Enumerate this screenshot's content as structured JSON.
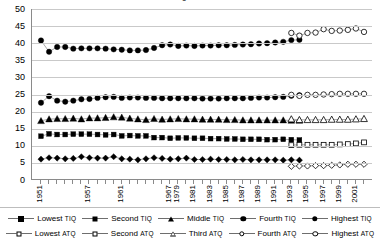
{
  "chart_data": {
    "type": "line",
    "title": "Figure 2",
    "xlabel": "",
    "ylabel": "",
    "ylim": [
      0,
      50
    ],
    "yticks": [
      0,
      5,
      10,
      15,
      20,
      25,
      30,
      35,
      40,
      45,
      50
    ],
    "grid": true,
    "legend_position": "bottom",
    "x": [
      1951,
      1952,
      1953,
      1954,
      1955,
      1956,
      1957,
      1958,
      1959,
      1960,
      1961,
      1962,
      1963,
      1964,
      1965,
      1966,
      1967,
      1979,
      1980,
      1981,
      1982,
      1983,
      1984,
      1985,
      1986,
      1987,
      1988,
      1989,
      1990,
      1991,
      1992,
      1993,
      1994,
      1995,
      1996,
      1997,
      1998,
      1999,
      2000,
      2001,
      2002
    ],
    "xtick_labels": [
      "1951",
      "1957",
      "1961",
      "1967",
      "1979",
      "1981",
      "1983",
      "1985",
      "1987",
      "1989",
      "1991",
      "1993",
      "1995",
      "1997",
      "1999",
      "2001"
    ],
    "xtick_positions": [
      1951,
      1957,
      1961,
      1967,
      1979,
      1981,
      1983,
      1985,
      1987,
      1989,
      1991,
      1993,
      1995,
      1997,
      1999,
      2001
    ],
    "series": [
      {
        "name": "Lowest TIQ",
        "marker": "diamond-filled",
        "group": "TIQ",
        "values": [
          6.1,
          6.5,
          6.4,
          6.2,
          6.3,
          6.8,
          6.5,
          6.4,
          6.4,
          6.8,
          6.2,
          6.1,
          5.9,
          6.2,
          6.5,
          6.3,
          6.1,
          6.2,
          6.4,
          6.0,
          6.0,
          6.1,
          6.0,
          6.0,
          5.9,
          6.0,
          5.9,
          5.9,
          5.9,
          5.9,
          5.8,
          5.9,
          5.8,
          null,
          null,
          null,
          null,
          null,
          null,
          null,
          null
        ]
      },
      {
        "name": "Second TIQ",
        "marker": "square-filled",
        "group": "TIQ",
        "values": [
          12.8,
          13.5,
          13.3,
          13.3,
          13.4,
          13.4,
          13.4,
          13.3,
          13.2,
          13.3,
          12.9,
          13.0,
          12.9,
          12.9,
          12.4,
          12.4,
          12.2,
          12.3,
          12.3,
          12.2,
          12.2,
          12.1,
          12.1,
          12.0,
          12.0,
          11.9,
          11.9,
          11.9,
          11.8,
          11.8,
          11.9,
          11.8,
          11.7,
          null,
          null,
          null,
          null,
          null,
          null,
          null,
          null
        ]
      },
      {
        "name": "Middle TIQ",
        "marker": "triangle-filled",
        "group": "TIQ",
        "values": [
          17.3,
          17.8,
          17.9,
          17.9,
          18.0,
          17.8,
          18.1,
          18.1,
          18.2,
          18.4,
          18.3,
          18.0,
          17.8,
          17.6,
          17.9,
          17.7,
          17.8,
          17.9,
          17.8,
          17.8,
          17.7,
          17.7,
          17.7,
          17.6,
          17.6,
          17.5,
          17.5,
          17.5,
          17.5,
          17.5,
          17.5,
          17.4,
          17.4,
          null,
          null,
          null,
          null,
          null,
          null,
          null,
          null
        ]
      },
      {
        "name": "Fourth TIQ",
        "marker": "circle-filled",
        "group": "TIQ",
        "values": [
          22.6,
          24.5,
          23.2,
          22.9,
          23.2,
          23.6,
          23.7,
          24.0,
          24.2,
          24.3,
          24.0,
          24.1,
          24.1,
          24.0,
          24.0,
          23.9,
          23.9,
          23.9,
          23.9,
          23.9,
          23.8,
          23.8,
          23.8,
          23.9,
          23.9,
          23.9,
          24.0,
          24.1,
          24.1,
          24.2,
          24.3,
          24.6,
          24.8,
          null,
          null,
          null,
          null,
          null,
          null,
          null,
          null
        ]
      },
      {
        "name": "Highest TIQ",
        "marker": "circle-filled",
        "group": "TIQ",
        "values": [
          40.8,
          37.5,
          38.9,
          38.9,
          38.4,
          38.5,
          38.5,
          38.5,
          38.4,
          38.2,
          38.1,
          37.9,
          37.9,
          38.0,
          38.6,
          39.4,
          39.6,
          39.2,
          39.3,
          39.2,
          39.3,
          39.3,
          39.4,
          39.4,
          39.5,
          39.6,
          39.7,
          39.9,
          40.0,
          40.2,
          40.4,
          40.9,
          41.0,
          null,
          null,
          null,
          null,
          null,
          null,
          null,
          null
        ]
      },
      {
        "name": "Lowest ATQ",
        "marker": "diamond-open",
        "group": "ATQ",
        "values": [
          null,
          null,
          null,
          null,
          null,
          null,
          null,
          null,
          null,
          null,
          null,
          null,
          null,
          null,
          null,
          null,
          null,
          null,
          null,
          null,
          null,
          null,
          null,
          null,
          null,
          null,
          null,
          null,
          null,
          null,
          null,
          4.0,
          4.1,
          4.1,
          4.2,
          4.2,
          4.3,
          4.4,
          4.6,
          4.6,
          4.6
        ]
      },
      {
        "name": "Second ATQ",
        "marker": "square-open",
        "group": "ATQ",
        "values": [
          null,
          null,
          null,
          null,
          null,
          null,
          null,
          null,
          null,
          null,
          null,
          null,
          null,
          null,
          null,
          null,
          null,
          null,
          null,
          null,
          null,
          null,
          null,
          null,
          null,
          null,
          null,
          null,
          null,
          null,
          null,
          10.2,
          10.3,
          10.3,
          10.3,
          10.3,
          10.3,
          10.4,
          10.5,
          10.7,
          11.0
        ]
      },
      {
        "name": "Third ATQ",
        "marker": "triangle-open",
        "group": "ATQ",
        "values": [
          null,
          null,
          null,
          null,
          null,
          null,
          null,
          null,
          null,
          null,
          null,
          null,
          null,
          null,
          null,
          null,
          null,
          null,
          null,
          null,
          null,
          null,
          null,
          null,
          null,
          null,
          null,
          null,
          null,
          null,
          null,
          17.8,
          17.6,
          17.6,
          17.6,
          17.6,
          17.7,
          17.7,
          17.7,
          17.8,
          17.9
        ]
      },
      {
        "name": "Fourth ATQ",
        "marker": "circle-open",
        "group": "ATQ",
        "values": [
          null,
          null,
          null,
          null,
          null,
          null,
          null,
          null,
          null,
          null,
          null,
          null,
          null,
          null,
          null,
          null,
          null,
          null,
          null,
          null,
          null,
          null,
          null,
          null,
          null,
          null,
          null,
          null,
          null,
          null,
          null,
          24.9,
          24.6,
          24.9,
          24.9,
          25.0,
          25.1,
          25.2,
          25.2,
          25.2,
          25.2
        ]
      },
      {
        "name": "Highest ATQ",
        "marker": "circle-open",
        "group": "ATQ",
        "values": [
          null,
          null,
          null,
          null,
          null,
          null,
          null,
          null,
          null,
          null,
          null,
          null,
          null,
          null,
          null,
          null,
          null,
          null,
          null,
          null,
          null,
          null,
          null,
          null,
          null,
          null,
          null,
          null,
          null,
          null,
          null,
          43.0,
          42.2,
          43.0,
          43.1,
          44.1,
          43.6,
          43.7,
          43.9,
          44.3,
          43.3
        ]
      }
    ]
  },
  "legend": {
    "row1": [
      {
        "label_main": "Lowest",
        "label_small": "TIQ",
        "marker": "diamond-filled"
      },
      {
        "label_main": "Second",
        "label_small": "TIQ",
        "marker": "square-filled"
      },
      {
        "label_main": "Middle",
        "label_small": "TIQ",
        "marker": "triangle-filled"
      },
      {
        "label_main": "Fourth",
        "label_small": "TIQ",
        "marker": "circle-filled"
      },
      {
        "label_main": "Highest",
        "label_small": "TIQ",
        "marker": "circle-filled"
      }
    ],
    "row2": [
      {
        "label_main": "Lowest",
        "label_small": "ATQ",
        "marker": "diamond-open"
      },
      {
        "label_main": "Second",
        "label_small": "ATQ",
        "marker": "square-open"
      },
      {
        "label_main": "Third",
        "label_small": "ATQ",
        "marker": "triangle-open"
      },
      {
        "label_main": "Fourth",
        "label_small": "ATQ",
        "marker": "circle-open"
      },
      {
        "label_main": "Highest",
        "label_small": "ATQ",
        "marker": "circle-open"
      }
    ]
  },
  "colors": {
    "series": "#000000",
    "line": "#6e6e6e",
    "grid": "#c9c9c9",
    "axis": "#8a8a8a",
    "background": "#ffffff"
  }
}
